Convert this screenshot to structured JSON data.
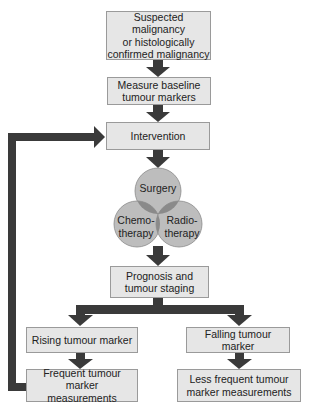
{
  "diagram": {
    "type": "flowchart",
    "nodes": {
      "suspected": "Suspected malignancy or histologically confirmed malignancy",
      "suspected_lines": [
        "Suspected malignancy",
        "or histologically",
        "confirmed malignancy"
      ],
      "baseline_lines": [
        "Measure baseline",
        "tumour markers"
      ],
      "intervention": "Intervention",
      "surgery": "Surgery",
      "chemo_lines": [
        "Chemo-",
        "therapy"
      ],
      "radio_lines": [
        "Radio-",
        "therapy"
      ],
      "prognosis_lines": [
        "Prognosis and",
        "tumour staging"
      ],
      "rising": "Rising tumour marker",
      "falling": "Falling tumour marker",
      "frequent_lines": [
        "Frequent tumour marker",
        "measurements"
      ],
      "less_frequent_lines": [
        "Less frequent tumour",
        "marker measurements"
      ]
    },
    "edges": [
      [
        "suspected",
        "baseline"
      ],
      [
        "baseline",
        "intervention"
      ],
      [
        "intervention",
        "treatment-venn"
      ],
      [
        "treatment-venn",
        "prognosis"
      ],
      [
        "prognosis",
        "rising"
      ],
      [
        "prognosis",
        "falling"
      ],
      [
        "rising",
        "frequent"
      ],
      [
        "falling",
        "less_frequent"
      ],
      [
        "frequent",
        "intervention"
      ]
    ],
    "colors": {
      "box_fill": "#e6e6e6",
      "box_border": "#9a9a9a",
      "arrow": "#3a3a3a",
      "circle_fill": "#bdbdbd",
      "circle_overlap": "#8a8a8a"
    }
  }
}
